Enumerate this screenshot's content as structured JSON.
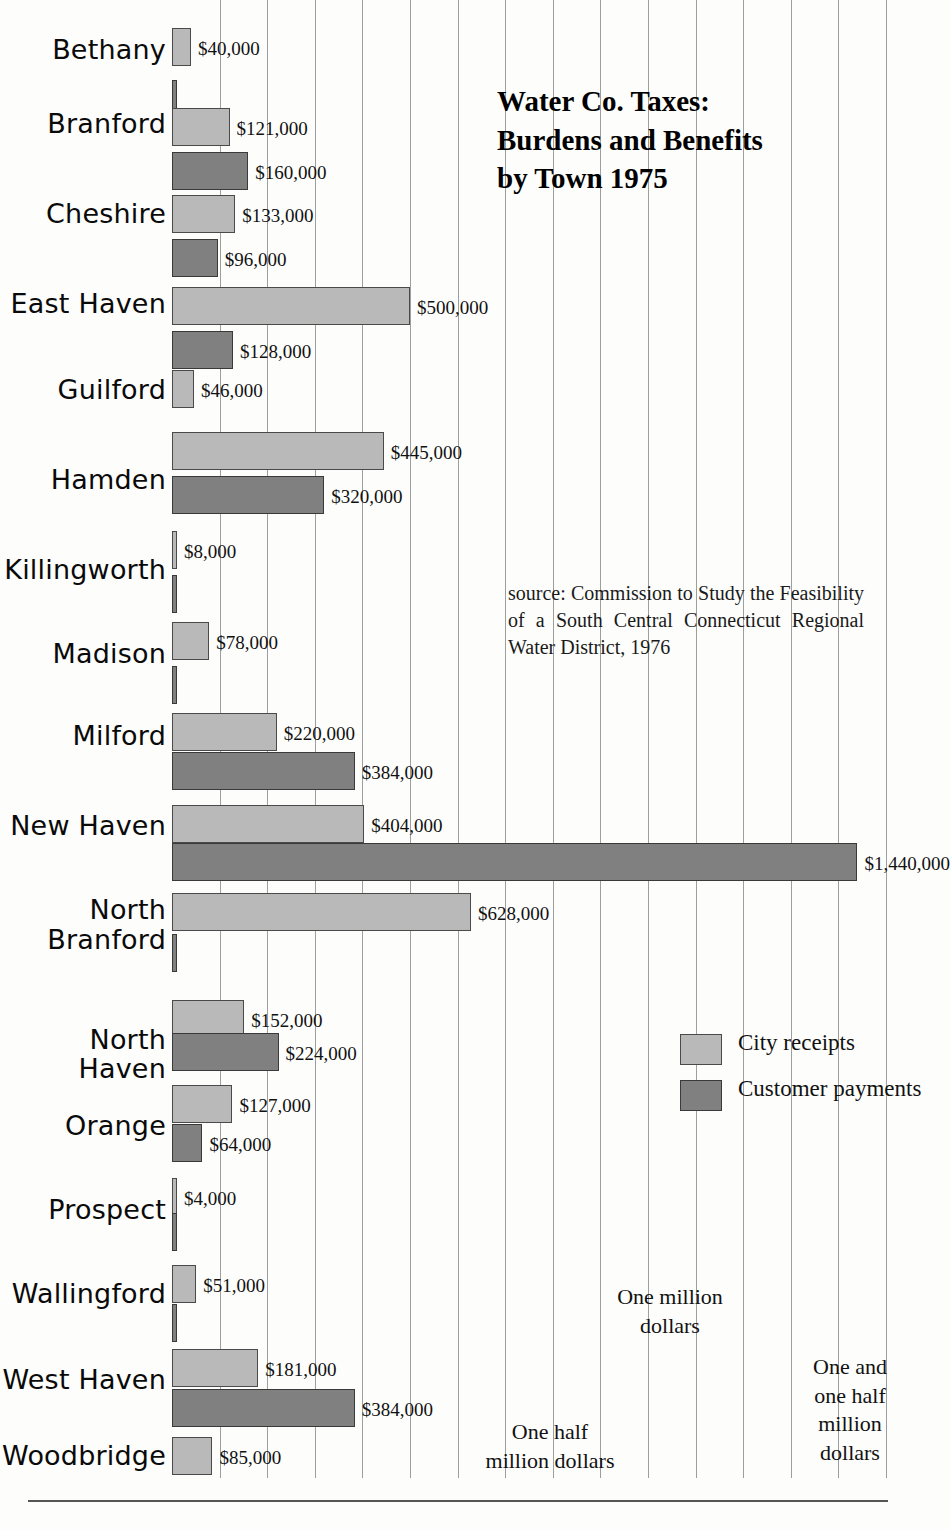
{
  "title": "Water Co. Taxes:\nBurdens and Benefits\nby Town 1975",
  "source": "source: Commission to Study the Feasibility of a South Central Connecticut Regional Water District, 1976",
  "legend": {
    "items": [
      {
        "label": "City receipts",
        "series": "city_receipts",
        "color": "#b9b9b9"
      },
      {
        "label": "Customer payments",
        "series": "customer_payments",
        "color": "#808080"
      }
    ]
  },
  "axis_notes": [
    {
      "text": "One half\nmillion dollars",
      "value": 500000
    },
    {
      "text": "One million\ndollars",
      "value": 1000000
    },
    {
      "text": "One and\none half\nmillion\ndollars",
      "value": 1500000
    }
  ],
  "chart_data": {
    "type": "bar",
    "orientation": "horizontal",
    "title": "Water Co. Taxes: Burdens and Benefits by Town 1975",
    "xlabel": "",
    "ylabel": "",
    "xlim": [
      0,
      1500000
    ],
    "grid": true,
    "grid_interval": 100000,
    "legend_position": "right",
    "categories": [
      "Bethany",
      "Branford",
      "Cheshire",
      "East Haven",
      "Guilford",
      "Hamden",
      "Killingworth",
      "Madison",
      "Milford",
      "New Haven",
      "North Branford",
      "North Haven",
      "Orange",
      "Prospect",
      "Wallingford",
      "West Haven",
      "Woodbridge"
    ],
    "series": [
      {
        "name": "City receipts",
        "color": "#b9b9b9",
        "values": [
          40000,
          121000,
          133000,
          500000,
          46000,
          445000,
          8000,
          78000,
          220000,
          404000,
          628000,
          152000,
          127000,
          4000,
          51000,
          181000,
          85000
        ],
        "labels": [
          "$40,000",
          "$121,000",
          "$133,000",
          "$500,000",
          "$46,000",
          "$445,000",
          "$8,000",
          "$78,000",
          "$220,000",
          "$404,000",
          "$628,000",
          "$152,000",
          "$127,000",
          "$4,000",
          "$51,000",
          "$181,000",
          "$85,000"
        ]
      },
      {
        "name": "Customer payments",
        "color": "#808080",
        "values": [
          3000,
          160000,
          96000,
          128000,
          0,
          320000,
          2500,
          3000,
          384000,
          1440000,
          3000,
          224000,
          64000,
          3500,
          3000,
          384000,
          0
        ],
        "labels": [
          "",
          "$160,000",
          "$96,000",
          "$128,000",
          "",
          "$320,000",
          "",
          "",
          "$384,000",
          "$1,440,000",
          "",
          "$224,000",
          "$64,000",
          "",
          "",
          "$384,000",
          ""
        ]
      }
    ]
  },
  "rows": [
    {
      "town": "Bethany",
      "lines": [
        "Bethany"
      ],
      "label_y": 36,
      "light_y": 28,
      "light_w": 40000,
      "light_label": "$40,000",
      "dark_y": 80,
      "dark_w": 3000,
      "dark_label": ""
    },
    {
      "town": "Branford",
      "lines": [
        "Branford"
      ],
      "label_y": 110,
      "light_y": 108,
      "light_w": 121000,
      "light_label": "$121,000",
      "dark_y": 152,
      "dark_w": 160000,
      "dark_label": "$160,000"
    },
    {
      "town": "Cheshire",
      "lines": [
        "Cheshire"
      ],
      "label_y": 200,
      "light_y": 195,
      "light_w": 133000,
      "light_label": "$133,000",
      "dark_y": 239,
      "dark_w": 96000,
      "dark_label": "$96,000"
    },
    {
      "town": "East Haven",
      "lines": [
        "East Haven"
      ],
      "label_y": 290,
      "light_y": 287,
      "light_w": 500000,
      "light_label": "$500,000",
      "dark_y": 331,
      "dark_w": 128000,
      "dark_label": "$128,000"
    },
    {
      "town": "Guilford",
      "lines": [
        "Guilford"
      ],
      "label_y": 376,
      "light_y": 370,
      "light_w": 46000,
      "light_label": "$46,000",
      "dark_y": 0,
      "dark_w": 0,
      "dark_label": ""
    },
    {
      "town": "Hamden",
      "lines": [
        "Hamden"
      ],
      "label_y": 466,
      "light_y": 432,
      "light_w": 445000,
      "light_label": "$445,000",
      "dark_y": 476,
      "dark_w": 320000,
      "dark_label": "$320,000"
    },
    {
      "town": "Killingworth",
      "lines": [
        "Killingworth"
      ],
      "label_y": 556,
      "light_y": 531,
      "light_w": 8000,
      "light_label": "$8,000",
      "dark_y": 575,
      "dark_w": 2500,
      "dark_label": ""
    },
    {
      "town": "Madison",
      "lines": [
        "Madison"
      ],
      "label_y": 640,
      "light_y": 622,
      "light_w": 78000,
      "light_label": "$78,000",
      "dark_y": 666,
      "dark_w": 3000,
      "dark_label": ""
    },
    {
      "town": "Milford",
      "lines": [
        "Milford"
      ],
      "label_y": 722,
      "light_y": 713,
      "light_w": 220000,
      "light_label": "$220,000",
      "dark_y": 752,
      "dark_w": 384000,
      "dark_label": "$384,000"
    },
    {
      "town": "New Haven",
      "lines": [
        "New Haven"
      ],
      "label_y": 812,
      "light_y": 805,
      "light_w": 404000,
      "light_label": "$404,000",
      "dark_y": 843,
      "dark_w": 1440000,
      "dark_label": "$1,440,000"
    },
    {
      "town": "North Branford",
      "lines": [
        "North",
        "Branford"
      ],
      "label_y": 895,
      "light_y": 893,
      "light_w": 628000,
      "light_label": "$628,000",
      "dark_y": 934,
      "dark_w": 3000,
      "dark_label": ""
    },
    {
      "town": "North Haven",
      "lines": [
        "North Haven"
      ],
      "label_y": 1026,
      "light_y": 1000,
      "light_w": 152000,
      "light_label": "$152,000",
      "dark_y": 1033,
      "dark_w": 224000,
      "dark_label": "$224,000"
    },
    {
      "town": "Orange",
      "lines": [
        "Orange"
      ],
      "label_y": 1112,
      "light_y": 1085,
      "light_w": 127000,
      "light_label": "$127,000",
      "dark_y": 1124,
      "dark_w": 64000,
      "dark_label": "$64,000"
    },
    {
      "town": "Prospect",
      "lines": [
        "Prospect"
      ],
      "label_y": 1196,
      "light_y": 1178,
      "light_w": 4000,
      "light_label": "$4,000",
      "dark_y": 1213,
      "dark_w": 3500,
      "dark_label": ""
    },
    {
      "town": "Wallingford",
      "lines": [
        "Wallingford"
      ],
      "label_y": 1280,
      "light_y": 1265,
      "light_w": 51000,
      "light_label": "$51,000",
      "dark_y": 1304,
      "dark_w": 3000,
      "dark_label": ""
    },
    {
      "town": "West Haven",
      "lines": [
        "West Haven"
      ],
      "label_y": 1366,
      "light_y": 1349,
      "light_w": 181000,
      "light_label": "$181,000",
      "dark_y": 1389,
      "dark_w": 384000,
      "dark_label": "$384,000"
    },
    {
      "town": "Woodbridge",
      "lines": [
        "Woodbridge"
      ],
      "label_y": 1442,
      "light_y": 1437,
      "light_w": 85000,
      "light_label": "$85,000",
      "dark_y": 0,
      "dark_w": 0,
      "dark_label": ""
    }
  ]
}
